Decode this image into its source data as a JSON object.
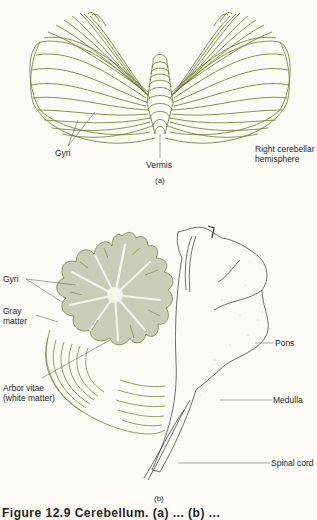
{
  "figure_a": {
    "labels": {
      "gyri": "Gyri",
      "vermis": "Vermis",
      "right_hemisphere_line1": "Right cerebellar",
      "right_hemisphere_line2": "hemisphere"
    },
    "sublabel": "(a)"
  },
  "figure_b": {
    "labels": {
      "gyri": "Gyri",
      "gray_matter_line1": "Gray",
      "gray_matter_line2": "matter",
      "arbor_vitae_line1": "Arbor vitae",
      "arbor_vitae_line2": "(white matter)",
      "pons": "Pons",
      "medulla": "Medulla",
      "spinal_cord": "Spinal cord"
    },
    "sublabel": "(b)"
  },
  "caption": "Figure 12.9  Cerebellum. (a) ... (b) ...",
  "colors": {
    "line": "#6b7a2a",
    "gray_matter": "#c9cdb8",
    "white_matter": "#f4f4ea",
    "background": "#fbfaf5",
    "label_text": "#2a2a2a"
  }
}
